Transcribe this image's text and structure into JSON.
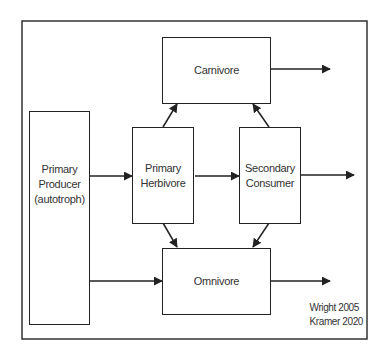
{
  "diagram": {
    "type": "food-web flow diagram",
    "nodes": {
      "primary_producer": "Primary\nProducer\n(autotroph)",
      "primary_herbivore": "Primary\nHerbivore",
      "secondary_consumer": "Secondary\nConsumer",
      "carnivore": "Carnivore",
      "omnivore": "Omnivore"
    },
    "edges": [
      {
        "from": "Primary Producer",
        "to": "Primary Herbivore"
      },
      {
        "from": "Primary Producer",
        "to": "Omnivore"
      },
      {
        "from": "Primary Herbivore",
        "to": "Secondary Consumer"
      },
      {
        "from": "Primary Herbivore",
        "to": "Carnivore"
      },
      {
        "from": "Primary Herbivore",
        "to": "Omnivore"
      },
      {
        "from": "Secondary Consumer",
        "to": "Carnivore"
      },
      {
        "from": "Secondary Consumer",
        "to": "Omnivore"
      },
      {
        "from": "Carnivore",
        "to": "outside"
      },
      {
        "from": "Secondary Consumer",
        "to": "outside"
      },
      {
        "from": "Omnivore",
        "to": "outside"
      }
    ],
    "credit": "Wright 2005\nKramer 2020",
    "colors": {
      "line": "#222222",
      "text": "#333333",
      "background": "#ffffff"
    }
  }
}
